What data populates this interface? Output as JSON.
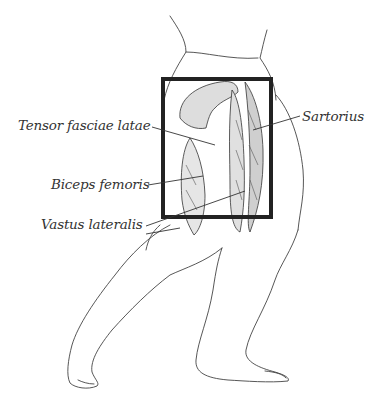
{
  "figure": {
    "highlight_box": {
      "x": 161,
      "y": 77,
      "width": 112,
      "height": 142,
      "border_color": "#222222"
    },
    "labels": [
      {
        "id": "tensor",
        "text": "Tensor fasciae latae",
        "x": 18,
        "y": 117
      },
      {
        "id": "sartorius",
        "text": "Sartorius",
        "x": 302,
        "y": 108
      },
      {
        "id": "biceps",
        "text": "Biceps femoris",
        "x": 51,
        "y": 176
      },
      {
        "id": "vastus",
        "text": "Vastus lateralis",
        "x": 41,
        "y": 216
      }
    ]
  }
}
